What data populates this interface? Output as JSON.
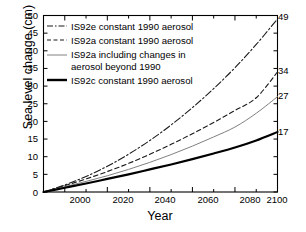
{
  "chart_data": {
    "type": "line",
    "title": "",
    "xlabel": "Year",
    "ylabel": "Sea level change (cm)",
    "xlim": [
      1990,
      2100
    ],
    "ylim": [
      0,
      50
    ],
    "xticks": [
      "2000",
      "2020",
      "2040",
      "2060",
      "2080",
      "2100"
    ],
    "xtick_values": [
      2000,
      2020,
      2040,
      2060,
      2080,
      2100
    ],
    "yticks": [
      "0",
      "5",
      "10",
      "15",
      "20",
      "25",
      "30",
      "35",
      "40",
      "45",
      "50"
    ],
    "ytick_values": [
      0,
      5,
      10,
      15,
      20,
      25,
      30,
      35,
      40,
      45,
      50
    ],
    "grid": false,
    "legend_position": "upper-left",
    "x": [
      1990,
      2000,
      2010,
      2020,
      2030,
      2040,
      2050,
      2060,
      2070,
      2080,
      2090,
      2100
    ],
    "series": [
      {
        "name": "IS92e constant 1990 aerosol",
        "style": "dash-dot",
        "color": "#1a1a1a",
        "width": 1.1,
        "end_label": "49",
        "end_value": 49,
        "values": [
          0,
          2.0,
          4.4,
          7.3,
          10.7,
          14.6,
          19.0,
          23.9,
          29.3,
          35.2,
          41.8,
          49.0
        ]
      },
      {
        "name": "IS92a constant 1990 aerosol",
        "style": "dashed",
        "color": "#1a1a1a",
        "width": 1.1,
        "end_label": "34",
        "end_value": 34,
        "values": [
          0,
          1.8,
          3.7,
          5.8,
          8.1,
          10.7,
          13.5,
          16.5,
          19.7,
          23.1,
          26.7,
          34.0
        ]
      },
      {
        "name": "IS92a including changes in aerosol beyond 1990",
        "style": "solid-thin",
        "color": "#808080",
        "width": 1.0,
        "end_label": "27",
        "end_value": 27,
        "values": [
          0,
          1.5,
          3.0,
          4.6,
          6.4,
          8.4,
          10.6,
          13.0,
          15.6,
          18.4,
          22.3,
          27.0
        ]
      },
      {
        "name": "IS92c constant 1990 aerosol",
        "style": "solid-thick",
        "color": "#000000",
        "width": 2.2,
        "end_label": "17",
        "end_value": 17,
        "values": [
          0,
          1.2,
          2.4,
          3.7,
          5.0,
          6.4,
          7.8,
          9.3,
          10.9,
          12.6,
          14.6,
          17.0
        ]
      }
    ],
    "legend_entries": [
      {
        "label_line1": "IS92e constant 1990 aerosol",
        "label_line2": ""
      },
      {
        "label_line1": "IS92a constant 1990 aerosol",
        "label_line2": ""
      },
      {
        "label_line1": "IS92a including changes in",
        "label_line2": "aerosol beyond 1990"
      },
      {
        "label_line1": "IS92c constant 1990 aerosol",
        "label_line2": ""
      }
    ]
  },
  "colors": {
    "axis": "#000000",
    "background": "#ffffff",
    "gray_series": "#808080"
  }
}
